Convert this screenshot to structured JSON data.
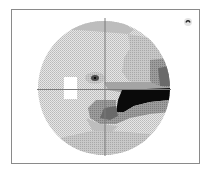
{
  "figure": {
    "type": "visual-field-greyscale-plot",
    "eye_icon": "eye-icon",
    "colors": {
      "frame": "#8a8a8a",
      "background": "#ffffff",
      "normal": "#d4d4d4",
      "mild": "#b8b8b8",
      "moderate": "#9a9a9a",
      "severe": "#6e6e6e",
      "absolute": "#0a0a0a",
      "blind_spot": "#ffffff",
      "axes": "#7a7a7a"
    }
  }
}
